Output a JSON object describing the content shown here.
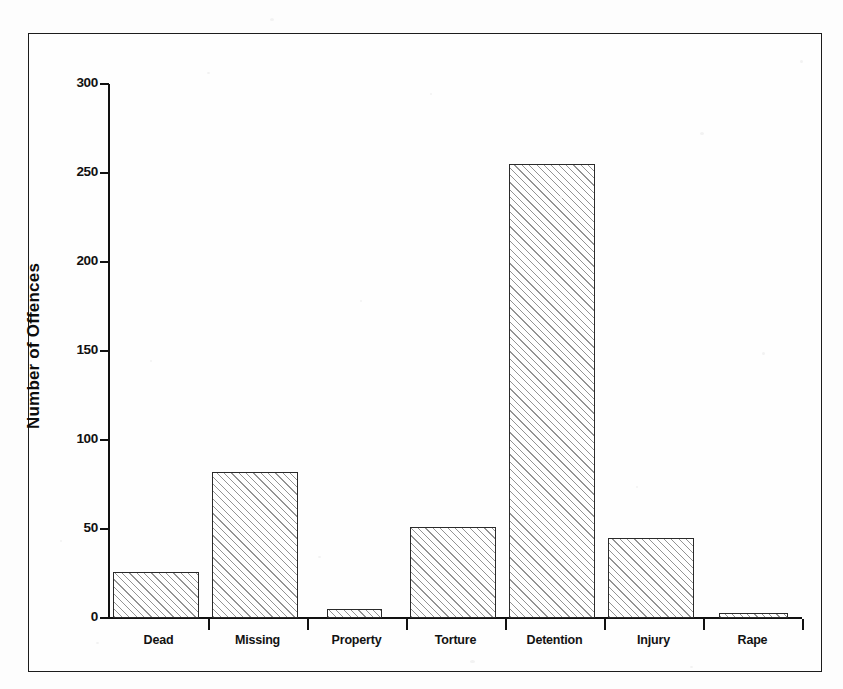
{
  "figure": {
    "background_color": "#fdfdfd",
    "frame_color": "#1c1c1c",
    "bar_outline_color": "#2a2a2a",
    "bar_fill": "diagonal-hatch"
  },
  "chart_data": {
    "type": "bar",
    "title": "",
    "xlabel": "",
    "ylabel": "Number of Offences",
    "categories": [
      "Dead",
      "Missing",
      "Property",
      "Torture",
      "Detention",
      "Injury",
      "Rape"
    ],
    "values": [
      26,
      82,
      5,
      51,
      255,
      45,
      3
    ],
    "ylim": [
      0,
      300
    ],
    "yticks": [
      0,
      50,
      100,
      150,
      200,
      250,
      300
    ],
    "ytick_labels": [
      "0",
      "50",
      "100",
      "150",
      "200",
      "250",
      "300"
    ],
    "grid": false,
    "legend": null
  }
}
